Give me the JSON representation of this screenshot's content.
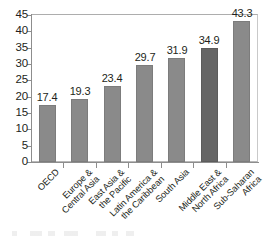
{
  "chart_data": {
    "type": "bar",
    "title": "",
    "xlabel": "",
    "ylabel": "",
    "ylim": [
      0,
      45
    ],
    "ytick_step": 5,
    "grid": false,
    "legend": "none",
    "orientation": "vertical",
    "categories": [
      "OECD",
      "Europe & Central Asia",
      "East Asia & the Pacific",
      "Latin America & the Caribbean",
      "South Asia",
      "Middle East & North Africa",
      "Sub-Saharan Africa"
    ],
    "category_lines": [
      [
        "OECD"
      ],
      [
        "Europe &",
        "Central Asia"
      ],
      [
        "East Asia &",
        "the Pacific"
      ],
      [
        "Latin America &",
        "the Caribbean"
      ],
      [
        "South Asia"
      ],
      [
        "Middle East &",
        "North Africa"
      ],
      [
        "Sub-Saharan",
        "Africa"
      ]
    ],
    "values": [
      17.4,
      19.3,
      23.4,
      29.7,
      31.9,
      34.9,
      43.3
    ],
    "value_labels": [
      "17.4",
      "19.3",
      "23.4",
      "29.7",
      "31.9",
      "34.9",
      "43.3"
    ],
    "ytick_labels": [
      "0",
      "5",
      "10",
      "15",
      "20",
      "25",
      "30",
      "35",
      "40",
      "45"
    ],
    "bar_colors": [
      "#8a8a8a",
      "#8a8a8a",
      "#8a8a8a",
      "#8a8a8a",
      "#8a8a8a",
      "#666666",
      "#8a8a8a"
    ],
    "axis_color": "#8d8d8d",
    "frame_color": "#b9b9b9",
    "text_color": "#231f20",
    "background": "#ffffff"
  }
}
